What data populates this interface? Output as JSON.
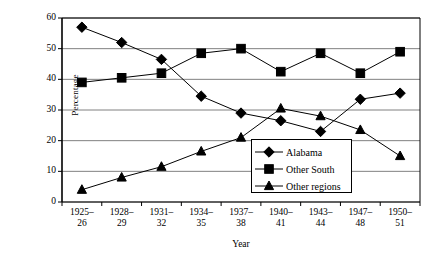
{
  "chart_data": {
    "type": "line",
    "title": "",
    "xlabel": "Year",
    "ylabel": "Percentage",
    "ylim": [
      0,
      60
    ],
    "yticks": [
      0,
      10,
      20,
      30,
      40,
      50,
      60
    ],
    "grid": "horizontal",
    "legend_position": "inside-bottom-right",
    "categories": [
      "1925–26",
      "1928–29",
      "1931–32",
      "1934–35",
      "1937–38",
      "1940–41",
      "1943–44",
      "1947–48",
      "1950–51"
    ],
    "series": [
      {
        "name": "Alabama",
        "marker": "diamond",
        "values": [
          57,
          52,
          46.5,
          34.5,
          29,
          26.5,
          23,
          33.5,
          35.5
        ]
      },
      {
        "name": "Other South",
        "marker": "square",
        "values": [
          39,
          40.5,
          42,
          48.5,
          50,
          42.5,
          48.5,
          42,
          49
        ]
      },
      {
        "name": "Other regions",
        "marker": "triangle",
        "values": [
          4,
          8,
          11.5,
          16.5,
          21,
          30.5,
          28,
          23.5,
          15
        ]
      }
    ],
    "colors": {
      "series": "#000000",
      "grid": "#808080",
      "axis": "#000000",
      "background": "#ffffff"
    }
  },
  "axis": {
    "y_title": "Percentage",
    "x_title": "Year",
    "y_tick_labels": [
      "60",
      "50",
      "40",
      "30",
      "20",
      "10",
      "0"
    ],
    "x_tick_labels": [
      {
        "line1": "1925–",
        "line2": "26"
      },
      {
        "line1": "1928–",
        "line2": "29"
      },
      {
        "line1": "1931–",
        "line2": "32"
      },
      {
        "line1": "1934–",
        "line2": "35"
      },
      {
        "line1": "1937–",
        "line2": "38"
      },
      {
        "line1": "1940–",
        "line2": "41"
      },
      {
        "line1": "1943–",
        "line2": "44"
      },
      {
        "line1": "1947–",
        "line2": "48"
      },
      {
        "line1": "1950–",
        "line2": "51"
      }
    ]
  },
  "legend": {
    "items": [
      {
        "label": "Alabama",
        "marker": "diamond"
      },
      {
        "label": "Other South",
        "marker": "square"
      },
      {
        "label": "Other regions",
        "marker": "triangle"
      }
    ]
  }
}
